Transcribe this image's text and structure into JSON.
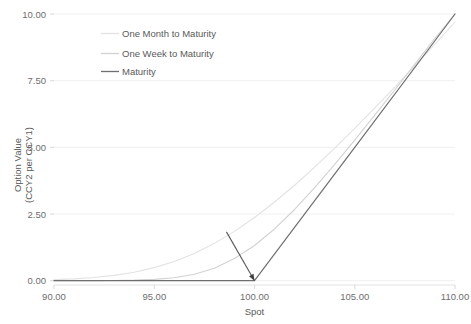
{
  "chart_data": {
    "type": "line",
    "title": "",
    "xlabel": "Spot",
    "ylabel": "Option Value\n(CCY2 per CCY1)",
    "ylabel_line1": "Option Value",
    "ylabel_line2": "(CCY2 per CCY1)",
    "xlim": [
      90.0,
      110.0
    ],
    "ylim": [
      0.0,
      10.0
    ],
    "xticks": [
      90.0,
      95.0,
      100.0,
      105.0,
      110.0
    ],
    "xtick_labels": [
      "90.00",
      "95.00",
      "100.00",
      "105.00",
      "110.00"
    ],
    "yticks": [
      0.0,
      2.5,
      5.0,
      7.5,
      10.0
    ],
    "ytick_labels": [
      "0.00",
      "2.50",
      "5.00",
      "7.50",
      "10.00"
    ],
    "grid": "horizontal",
    "legend_position": "upper-left-inside",
    "strike": 100.0,
    "series": [
      {
        "name": "One Month to Maturity",
        "color": "#e3e3e3",
        "width": 1.1,
        "x": [
          90.0,
          91.0,
          92.0,
          93.0,
          94.0,
          95.0,
          96.0,
          97.0,
          98.0,
          99.0,
          100.0,
          101.0,
          102.0,
          103.0,
          104.0,
          105.0,
          106.0,
          107.0,
          108.0,
          109.0,
          110.0
        ],
        "values": [
          0.04,
          0.07,
          0.12,
          0.2,
          0.32,
          0.49,
          0.72,
          1.02,
          1.4,
          1.85,
          2.37,
          2.95,
          3.58,
          4.26,
          4.97,
          5.71,
          6.48,
          7.26,
          8.06,
          8.87,
          9.7
        ]
      },
      {
        "name": "One Week to Maturity",
        "color": "#d2d2d2",
        "width": 1.1,
        "x": [
          90.0,
          91.0,
          92.0,
          93.0,
          94.0,
          95.0,
          96.0,
          97.0,
          98.0,
          99.0,
          100.0,
          101.0,
          102.0,
          103.0,
          104.0,
          105.0,
          106.0,
          107.0,
          108.0,
          109.0,
          110.0
        ],
        "values": [
          0.0,
          0.0,
          0.0,
          0.01,
          0.02,
          0.05,
          0.11,
          0.24,
          0.47,
          0.83,
          1.32,
          1.94,
          2.67,
          3.49,
          4.36,
          5.27,
          6.21,
          7.16,
          8.12,
          9.09,
          10.0
        ]
      },
      {
        "name": "Maturity",
        "color": "#6f6f6f",
        "width": 1.2,
        "x": [
          90.0,
          95.0,
          100.0,
          105.0,
          110.0
        ],
        "values": [
          0.0,
          0.0,
          0.0,
          5.0,
          10.0
        ]
      }
    ],
    "annotations": [
      {
        "type": "arrow",
        "name": "strike-pointer-arrow",
        "from_x": 98.6,
        "from_y": 1.83,
        "to_x": 100.0,
        "to_y": 0.0,
        "color": "#595959"
      }
    ]
  },
  "legend": {
    "items": [
      {
        "label": "One Month to Maturity",
        "swatch_color": "#e3e3e3"
      },
      {
        "label": "One Week to Maturity",
        "swatch_color": "#d2d2d2"
      },
      {
        "label": "Maturity",
        "swatch_color": "#6f6f6f"
      }
    ]
  },
  "axes": {
    "x_title": "Spot",
    "y_title_line1": "Option Value",
    "y_title_line2": "(CCY2 per CCY1)",
    "x_tick_labels": [
      "90.00",
      "95.00",
      "100.00",
      "105.00",
      "110.00"
    ],
    "y_tick_labels": [
      "0.00",
      "2.50",
      "5.00",
      "7.50",
      "10.00"
    ]
  },
  "colors": {
    "background": "#ffffff",
    "gridline": "#f2f0f2",
    "axis_text": "#6e6e6e",
    "one_month": "#e3e3e3",
    "one_week": "#d2d2d2",
    "maturity": "#6f6f6f",
    "annotation": "#595959"
  }
}
